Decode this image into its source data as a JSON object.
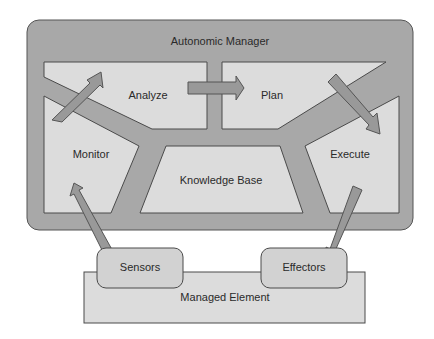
{
  "title": "Autonomic Manager",
  "phases": {
    "analyze": "Analyze",
    "plan": "Plan",
    "monitor": "Monitor",
    "execute": "Execute"
  },
  "knowledge_base": "Knowledge Base",
  "sensors": "Sensors",
  "effectors": "Effectors",
  "managed_element": "Managed Element",
  "colors": {
    "frame": "#a8a8a8",
    "panel": "#dcdcdc",
    "arrow": "#999999",
    "stroke": "#4a4a4a",
    "text": "#2a2a2a"
  }
}
